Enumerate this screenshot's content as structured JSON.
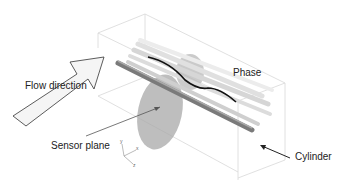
{
  "diagram": {
    "labels": {
      "flow_direction": "Flow direction",
      "phase": "Phase",
      "sensor_plane": "Sensor plane",
      "cylinder": "Cylinder"
    },
    "axes": {
      "y": "y",
      "x": "x",
      "z": "z"
    },
    "colors": {
      "box_edges": "#d4d4d4",
      "arrow_outline": "#333333",
      "arrow_fill": "#f4f4f4",
      "cylinder": "#8a8a8a",
      "streamlines": "#d0d0d0",
      "phase_curve": "#111111",
      "sensor_plane": "#9a9a9a"
    }
  }
}
